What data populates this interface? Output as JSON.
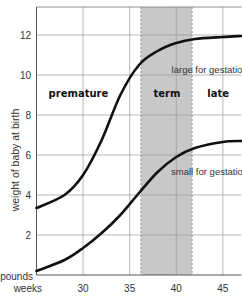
{
  "chart_data": {
    "type": "line",
    "title": "",
    "xlabel": "weeks",
    "ylabel": "weight of baby at birth",
    "y_unit_label": "pounds",
    "xlim": [
      25,
      47
    ],
    "ylim": [
      0,
      13.4
    ],
    "x_ticks": [
      30,
      35,
      40,
      45
    ],
    "y_ticks": [
      2,
      4,
      6,
      8,
      10,
      12
    ],
    "grid": true,
    "shaded_region": {
      "label": "term",
      "x_start": 36.2,
      "x_end": 41.7,
      "color": "#c8c8c8"
    },
    "regions": [
      {
        "label": "premature",
        "x": 29.5,
        "y": 8.9
      },
      {
        "label": "term",
        "x": 39,
        "y": 8.9
      },
      {
        "label": "late",
        "x": 44.5,
        "y": 8.9
      }
    ],
    "x": [
      25,
      28,
      30,
      32,
      34,
      36,
      38,
      40,
      42,
      45,
      47
    ],
    "series": [
      {
        "name": "large for gestation",
        "values": [
          3.35,
          4.0,
          5.0,
          6.75,
          9.0,
          10.5,
          11.2,
          11.6,
          11.8,
          11.9,
          11.95
        ]
      },
      {
        "name": "small for gestation",
        "values": [
          0.2,
          0.75,
          1.35,
          2.1,
          3.0,
          4.1,
          5.15,
          5.9,
          6.35,
          6.65,
          6.7
        ]
      }
    ],
    "annotations": [
      {
        "text": "large for gestation",
        "x": 39.5,
        "y": 10.1
      },
      {
        "text": "small for gestation",
        "x": 39.5,
        "y": 5.0
      }
    ],
    "line_color": "#111111"
  }
}
